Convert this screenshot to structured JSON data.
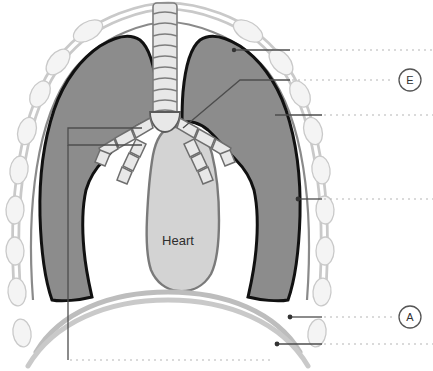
{
  "figure": {
    "organ_labels": [
      {
        "id": "heart",
        "text": "Heart",
        "x": 178,
        "y": 240
      }
    ],
    "callout_markers": [
      {
        "id": "marker-e",
        "text": "E",
        "cx": 410,
        "cy": 80,
        "r": 11
      },
      {
        "id": "marker-a",
        "text": "A",
        "cx": 410,
        "cy": 317,
        "r": 11
      }
    ],
    "leader_lines": [
      {
        "id": "leader-1",
        "solid_from_x": 234,
        "solid_to_x": 290,
        "y": 50,
        "dotted_from_x": 292,
        "dotted_to_x": 433,
        "anchor": false
      },
      {
        "id": "leader-2",
        "solid_from_x": 270,
        "solid_to_x": 290,
        "y": 80,
        "dotted_from_x": 292,
        "dotted_to_x": 392,
        "anchor": false
      },
      {
        "id": "leader-3",
        "solid_from_x": 297,
        "solid_to_x": 322,
        "y": 115,
        "dotted_from_x": 324,
        "dotted_to_x": 433,
        "anchor": false
      },
      {
        "id": "leader-4",
        "solid_from_x": 296,
        "solid_to_x": 322,
        "y": 199,
        "dotted_from_x": 324,
        "dotted_to_x": 433,
        "anchor": true,
        "anchor_x": 298
      },
      {
        "id": "leader-5",
        "solid_from_x": 288,
        "solid_to_x": 322,
        "y": 317,
        "dotted_from_x": 324,
        "dotted_to_x": 392,
        "anchor": true,
        "anchor_x": 290
      },
      {
        "id": "leader-6",
        "solid_from_x": 275,
        "solid_to_x": 322,
        "y": 344,
        "dotted_from_x": 324,
        "dotted_to_x": 433,
        "anchor": true,
        "anchor_x": 277
      },
      {
        "id": "leader-7-bottom",
        "y": 360,
        "dotted_from_x": 70,
        "dotted_to_x": 270,
        "vertical_x": 68,
        "vertical_from_y": 135,
        "vertical_to_y": 360
      }
    ],
    "colors": {
      "lung_fill": "#8c8c8c",
      "lung_outline": "#1a1a1a",
      "heart_fill": "#d3d3d3",
      "heart_outline": "#6e6e6e",
      "pleura_band": "#b9b9b9",
      "rib_fill": "#f2f2f2",
      "rib_stroke": "#c3c3c3",
      "trachea_fill": "#e6e6e6",
      "trachea_stroke": "#7d7d7d",
      "diaphragm": "#b5b5b5",
      "leader": "#4d4d4d",
      "dotted": "#b0b0b0",
      "text": "#303030",
      "background": "#ffffff"
    },
    "anatomy_parts": [
      "rib-cage",
      "pleural-membrane",
      "left-lung",
      "right-lung",
      "trachea",
      "left-bronchus",
      "right-bronchus",
      "heart",
      "diaphragm"
    ]
  }
}
